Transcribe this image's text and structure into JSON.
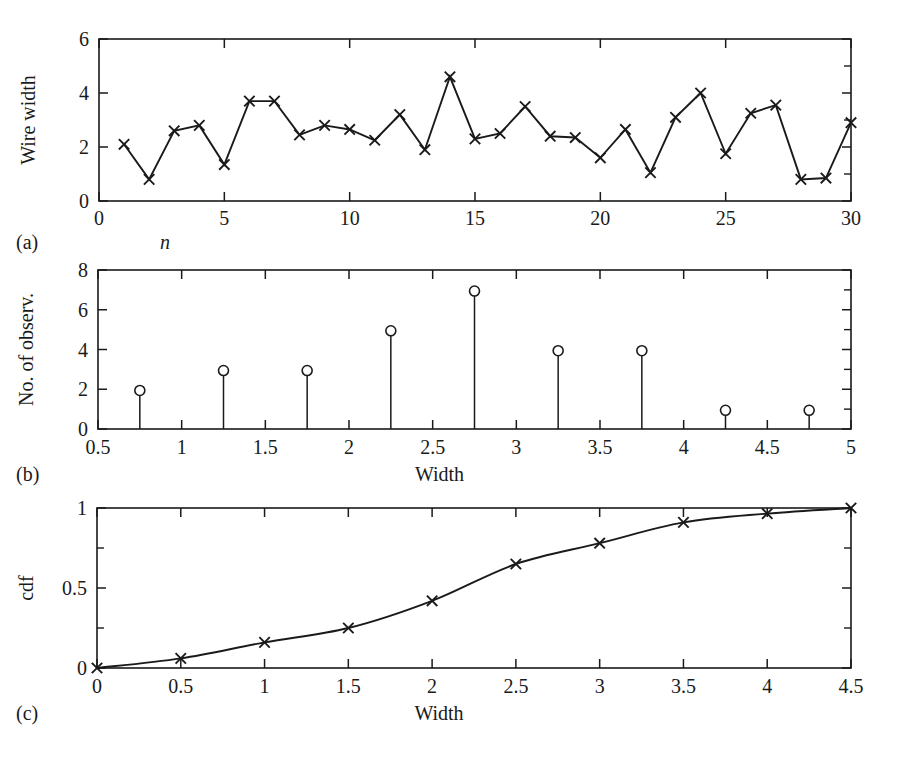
{
  "figure": {
    "background": "#ffffff",
    "ink": "#1a1a1a"
  },
  "panels": [
    {
      "tag": "(a)",
      "ylabel": "Wire width",
      "xlabel": "n",
      "xlabel_italic": true
    },
    {
      "tag": "(b)",
      "ylabel": "No. of observ.",
      "xlabel": "Width",
      "xlabel_italic": false
    },
    {
      "tag": "(c)",
      "ylabel": "cdf",
      "xlabel": "Width",
      "xlabel_italic": false
    }
  ],
  "chart_data": [
    {
      "type": "line",
      "title": "",
      "panel": "(a)",
      "xlabel": "n",
      "ylabel": "Wire width",
      "xlim": [
        0,
        30
      ],
      "ylim": [
        0,
        6
      ],
      "xticks": [
        0,
        5,
        10,
        15,
        20,
        25,
        30
      ],
      "xtick_labels": [
        "0",
        "5",
        "10",
        "15",
        "20",
        "25",
        "30"
      ],
      "xticks_minor": [
        1,
        2,
        3,
        4,
        6,
        7,
        8,
        9,
        11,
        12,
        13,
        14,
        16,
        17,
        18,
        19,
        21,
        22,
        23,
        24,
        26,
        27,
        28,
        29
      ],
      "yticks": [
        0,
        2,
        4,
        6
      ],
      "ytick_labels": [
        "0",
        "2",
        "4",
        "6"
      ],
      "yticks_minor": [
        1,
        3,
        5
      ],
      "grid": false,
      "legend": null,
      "marker": "x",
      "x": [
        1,
        2,
        3,
        4,
        5,
        6,
        7,
        8,
        9,
        10,
        11,
        12,
        13,
        14,
        15,
        16,
        17,
        18,
        19,
        20,
        21,
        22,
        23,
        24,
        25,
        26,
        27,
        28,
        29,
        30
      ],
      "values": [
        2.1,
        0.8,
        2.6,
        2.8,
        1.35,
        3.7,
        3.7,
        2.45,
        2.8,
        2.65,
        2.25,
        3.2,
        1.9,
        4.6,
        2.3,
        2.5,
        3.5,
        2.4,
        2.35,
        1.6,
        2.65,
        1.05,
        3.1,
        4.0,
        1.75,
        3.25,
        3.55,
        0.8,
        0.85,
        2.9
      ]
    },
    {
      "type": "bar",
      "subtype": "stem",
      "title": "",
      "panel": "(b)",
      "xlabel": "Width",
      "ylabel": "No. of observ.",
      "xlim": [
        0.5,
        5
      ],
      "ylim": [
        0,
        8
      ],
      "xticks": [
        0.5,
        1,
        1.5,
        2,
        2.5,
        3,
        3.5,
        4,
        4.5,
        5
      ],
      "xtick_labels": [
        "0.5",
        "1",
        "1.5",
        "2",
        "2.5",
        "3",
        "3.5",
        "4",
        "4.5",
        "5"
      ],
      "yticks": [
        0,
        2,
        4,
        6,
        8
      ],
      "ytick_labels": [
        "0",
        "2",
        "4",
        "6",
        "8"
      ],
      "yticks_minor": [
        1,
        3,
        5,
        7
      ],
      "grid": false,
      "legend": null,
      "marker": "o",
      "categories": [
        "0.75",
        "1.25",
        "1.75",
        "2.25",
        "2.75",
        "3.25",
        "3.75",
        "4.25",
        "4.75"
      ],
      "x": [
        0.75,
        1.25,
        1.75,
        2.25,
        2.75,
        3.25,
        3.75,
        4.25,
        4.75
      ],
      "values": [
        2,
        3,
        3,
        5,
        7,
        4,
        4,
        1,
        1
      ]
    },
    {
      "type": "line",
      "title": "",
      "panel": "(c)",
      "xlabel": "Width",
      "ylabel": "cdf",
      "xlim": [
        0,
        4.5
      ],
      "ylim": [
        0,
        1
      ],
      "xticks": [
        0,
        0.5,
        1,
        1.5,
        2,
        2.5,
        3,
        3.5,
        4,
        4.5
      ],
      "xtick_labels": [
        "0",
        "0.5",
        "1",
        "1.5",
        "2",
        "2.5",
        "3",
        "3.5",
        "4",
        "4.5"
      ],
      "yticks": [
        0,
        0.5,
        1
      ],
      "ytick_labels": [
        "0",
        "0.5",
        "1"
      ],
      "yticks_minor": [
        0.25,
        0.75
      ],
      "grid": false,
      "legend": null,
      "marker": "x",
      "x": [
        0,
        0.5,
        1,
        1.5,
        2,
        2.5,
        3,
        3.5,
        4,
        4.5
      ],
      "values": [
        0,
        0.06,
        0.16,
        0.25,
        0.42,
        0.65,
        0.78,
        0.91,
        0.965,
        1.0
      ]
    }
  ]
}
